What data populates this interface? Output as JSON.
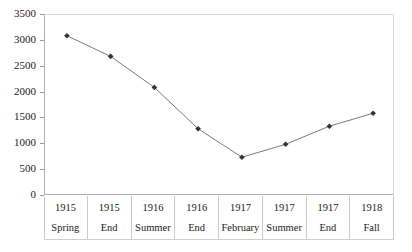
{
  "chart_data": {
    "type": "line",
    "title": "",
    "subtitle": "",
    "xlabel": "",
    "ylabel": "",
    "ylim": [
      0,
      3500
    ],
    "ytick_step": 500,
    "yticks": [
      0,
      500,
      1000,
      1500,
      2000,
      2500,
      3000,
      3500
    ],
    "ytick_labels": [
      "0",
      "500",
      "1000",
      "1500",
      "2000",
      "2500",
      "3000",
      "3500"
    ],
    "grid": false,
    "legend": null,
    "marker": "diamond",
    "line_color": "#7a7a7a",
    "marker_color": "#333333",
    "categories": [
      "1915 Spring",
      "1915 End",
      "1916 Summer",
      "1916 End",
      "1917 February",
      "1917 Summer",
      "1917 End",
      "1918 Fall"
    ],
    "x_axis_rows": {
      "years": [
        "1915",
        "1915",
        "1916",
        "1916",
        "1917",
        "1917",
        "1917",
        "1918"
      ],
      "seasons": [
        "Spring",
        "End",
        "Summer",
        "End",
        "February",
        "Summer",
        "End",
        "Fall"
      ]
    },
    "values": [
      3100,
      2700,
      2100,
      1300,
      750,
      1000,
      1350,
      1600
    ],
    "series": [
      {
        "name": "",
        "values": [
          3100,
          2700,
          2100,
          1300,
          750,
          1000,
          1350,
          1600
        ]
      }
    ]
  },
  "caption": {
    "text": ""
  }
}
